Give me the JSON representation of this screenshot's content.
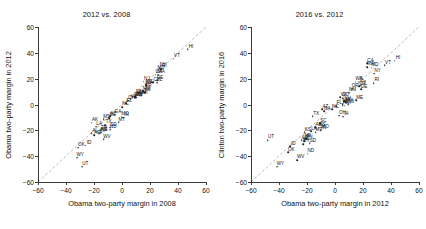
{
  "chart_data": [
    {
      "type": "scatter",
      "title": "2012 vs. 2008",
      "xlabel": "Obama two-party margin in 2008",
      "ylabel": "Obama two-party margin in 2012",
      "xlim": [
        -60,
        60
      ],
      "ylim": [
        -60,
        60
      ],
      "xticks": [
        -60,
        -40,
        -20,
        0,
        20,
        40,
        60
      ],
      "yticks": [
        -60,
        -40,
        -20,
        0,
        20,
        40,
        60
      ],
      "grid": false,
      "legend": "none",
      "reference_line": {
        "type": "identity",
        "label": "y = x",
        "style": "dashed",
        "color": "#b8b8b8"
      },
      "point_label_field": "state",
      "points": [
        {
          "state": "HI",
          "x": 47.0,
          "y": 42.7
        },
        {
          "state": "VT",
          "x": 37.0,
          "y": 35.6
        },
        {
          "state": "NY",
          "x": 26.9,
          "y": 28.2
        },
        {
          "state": "RI",
          "x": 28.1,
          "y": 27.5
        },
        {
          "state": "MD",
          "x": 25.6,
          "y": 26.1
        },
        {
          "state": "MA",
          "x": 25.8,
          "y": 23.1
        },
        {
          "state": "CA",
          "x": 24.0,
          "y": 23.1
        },
        {
          "state": "DE",
          "x": 25.0,
          "y": 18.6
        },
        {
          "state": "NJ",
          "x": 15.5,
          "y": 17.8
        },
        {
          "state": "CT",
          "x": 22.4,
          "y": 17.3
        },
        {
          "state": "IL",
          "x": 25.1,
          "y": 16.9
        },
        {
          "state": "WA",
          "x": 17.1,
          "y": 14.9
        },
        {
          "state": "ME",
          "x": 17.3,
          "y": 15.3
        },
        {
          "state": "OR",
          "x": 16.4,
          "y": 12.1
        },
        {
          "state": "MI",
          "x": 16.5,
          "y": 9.5
        },
        {
          "state": "NM",
          "x": 15.1,
          "y": 10.2
        },
        {
          "state": "MN",
          "x": 10.3,
          "y": 7.7
        },
        {
          "state": "WI",
          "x": 13.9,
          "y": 6.9
        },
        {
          "state": "NV",
          "x": 12.5,
          "y": 6.7
        },
        {
          "state": "PA",
          "x": 10.3,
          "y": 5.4
        },
        {
          "state": "IA",
          "x": 9.5,
          "y": 5.8
        },
        {
          "state": "NH",
          "x": 9.6,
          "y": 5.6
        },
        {
          "state": "CO",
          "x": 9.0,
          "y": 5.4
        },
        {
          "state": "VA",
          "x": 6.3,
          "y": 3.9
        },
        {
          "state": "OH",
          "x": 4.6,
          "y": 3.0
        },
        {
          "state": "FL",
          "x": 2.8,
          "y": 0.9
        },
        {
          "state": "NC",
          "x": 0.3,
          "y": -2.0
        },
        {
          "state": "IN",
          "x": 1.0,
          "y": -10.2
        },
        {
          "state": "MO",
          "x": -0.1,
          "y": -9.4
        },
        {
          "state": "GA",
          "x": -5.2,
          "y": -7.8
        },
        {
          "state": "MT",
          "x": -2.4,
          "y": -13.7
        },
        {
          "state": "AZ",
          "x": -8.5,
          "y": -9.1
        },
        {
          "state": "SD",
          "x": -8.4,
          "y": -18.0
        },
        {
          "state": "ND",
          "x": -8.6,
          "y": -19.6
        },
        {
          "state": "SC",
          "x": -9.0,
          "y": -10.5
        },
        {
          "state": "MS",
          "x": -13.2,
          "y": -11.5
        },
        {
          "state": "TX",
          "x": -11.8,
          "y": -15.8
        },
        {
          "state": "WV",
          "x": -13.1,
          "y": -26.8
        },
        {
          "state": "TN",
          "x": -15.1,
          "y": -20.4
        },
        {
          "state": "LA",
          "x": -18.6,
          "y": -17.2
        },
        {
          "state": "KY",
          "x": -16.2,
          "y": -22.7
        },
        {
          "state": "KS",
          "x": -15.0,
          "y": -21.7
        },
        {
          "state": "NE",
          "x": -15.1,
          "y": -21.8
        },
        {
          "state": "AR",
          "x": -19.9,
          "y": -23.7
        },
        {
          "state": "AL",
          "x": -21.6,
          "y": -22.2
        },
        {
          "state": "AK",
          "x": -21.5,
          "y": -14.0
        },
        {
          "state": "ID",
          "x": -25.8,
          "y": -32.0
        },
        {
          "state": "OK",
          "x": -31.3,
          "y": -33.5
        },
        {
          "state": "WY",
          "x": -32.2,
          "y": -41.3
        },
        {
          "state": "UT",
          "x": -28.5,
          "y": -48.0
        }
      ]
    },
    {
      "type": "scatter",
      "title": "2016 vs. 2012",
      "xlabel": "Obama two-party margin in 2012",
      "ylabel": "Clinton two-party margin in 2016",
      "xlim": [
        -60,
        60
      ],
      "ylim": [
        -60,
        60
      ],
      "xticks": [
        -60,
        -40,
        -20,
        0,
        20,
        40,
        60
      ],
      "yticks": [
        -60,
        -40,
        -20,
        0,
        20,
        40,
        60
      ],
      "grid": false,
      "legend": "none",
      "reference_line": {
        "type": "identity",
        "label": "y = x",
        "style": "dashed",
        "color": "#b8b8b8"
      },
      "point_label_field": "state",
      "points": [
        {
          "state": "HI",
          "x": 42.7,
          "y": 34.0
        },
        {
          "state": "VT",
          "x": 35.6,
          "y": 30.4
        },
        {
          "state": "CA",
          "x": 23.1,
          "y": 31.9
        },
        {
          "state": "MA",
          "x": 23.1,
          "y": 29.0
        },
        {
          "state": "MD",
          "x": 26.1,
          "y": 28.4
        },
        {
          "state": "NY",
          "x": 28.2,
          "y": 24.0
        },
        {
          "state": "RI",
          "x": 27.5,
          "y": 16.7
        },
        {
          "state": "WA",
          "x": 14.9,
          "y": 17.8
        },
        {
          "state": "IL",
          "x": 16.9,
          "y": 17.7
        },
        {
          "state": "CT",
          "x": 17.3,
          "y": 14.2
        },
        {
          "state": "OR",
          "x": 12.1,
          "y": 12.3
        },
        {
          "state": "DE",
          "x": 18.6,
          "y": 11.8
        },
        {
          "state": "NJ",
          "x": 17.8,
          "y": 14.6
        },
        {
          "state": "NM",
          "x": 10.2,
          "y": 9.0
        },
        {
          "state": "VA",
          "x": 3.9,
          "y": 5.5
        },
        {
          "state": "CO",
          "x": 5.4,
          "y": 5.0
        },
        {
          "state": "ME",
          "x": 15.3,
          "y": 3.1
        },
        {
          "state": "NV",
          "x": 6.7,
          "y": 2.5
        },
        {
          "state": "MN",
          "x": 7.7,
          "y": 1.6
        },
        {
          "state": "NH",
          "x": 5.6,
          "y": 0.4
        },
        {
          "state": "AZ",
          "x": -9.1,
          "y": -3.6
        },
        {
          "state": "FL",
          "x": 0.9,
          "y": -1.2
        },
        {
          "state": "MI",
          "x": 9.5,
          "y": -0.2
        },
        {
          "state": "WI",
          "x": 6.9,
          "y": -0.8
        },
        {
          "state": "PA",
          "x": 5.4,
          "y": -0.7
        },
        {
          "state": "NC",
          "x": -2.0,
          "y": -3.8
        },
        {
          "state": "GA",
          "x": -7.8,
          "y": -5.3
        },
        {
          "state": "OH",
          "x": 3.0,
          "y": -8.6
        },
        {
          "state": "IA",
          "x": 5.8,
          "y": -9.6
        },
        {
          "state": "TX",
          "x": -15.8,
          "y": -9.2
        },
        {
          "state": "SC",
          "x": -10.5,
          "y": -14.6
        },
        {
          "state": "AK",
          "x": -14.0,
          "y": -17.6
        },
        {
          "state": "MS",
          "x": -11.5,
          "y": -18.0
        },
        {
          "state": "MO",
          "x": -9.4,
          "y": -19.4
        },
        {
          "state": "IN",
          "x": -10.2,
          "y": -19.9
        },
        {
          "state": "LA",
          "x": -17.2,
          "y": -20.6
        },
        {
          "state": "MT",
          "x": -13.7,
          "y": -21.6
        },
        {
          "state": "KS",
          "x": -21.7,
          "y": -21.6
        },
        {
          "state": "UT",
          "x": -48.0,
          "y": -27.5
        },
        {
          "state": "TN",
          "x": -20.4,
          "y": -26.8
        },
        {
          "state": "NE",
          "x": -21.8,
          "y": -26.6
        },
        {
          "state": "AL",
          "x": -22.2,
          "y": -28.5
        },
        {
          "state": "AR",
          "x": -23.7,
          "y": -27.8
        },
        {
          "state": "SD",
          "x": -18.0,
          "y": -29.9
        },
        {
          "state": "ID",
          "x": -32.0,
          "y": -32.5
        },
        {
          "state": "KY",
          "x": -22.7,
          "y": -30.6
        },
        {
          "state": "OK",
          "x": -33.5,
          "y": -37.1
        },
        {
          "state": "ND",
          "x": -19.6,
          "y": -38.0
        },
        {
          "state": "WV",
          "x": -26.8,
          "y": -43.0
        },
        {
          "state": "WY",
          "x": -41.3,
          "y": -48.3
        }
      ]
    }
  ]
}
